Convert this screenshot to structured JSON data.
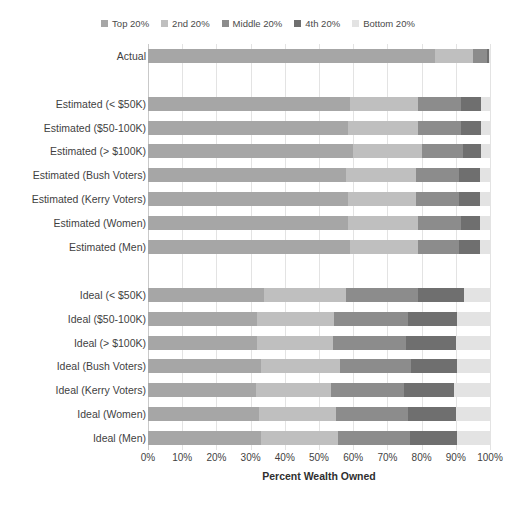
{
  "chart_data": {
    "type": "bar",
    "orientation": "horizontal",
    "stacked": true,
    "title": "",
    "xlabel": "Percent Wealth Owned",
    "ylabel": "",
    "xlim": [
      0,
      100
    ],
    "xticks": [
      "0%",
      "10%",
      "20%",
      "30%",
      "40%",
      "50%",
      "60%",
      "70%",
      "80%",
      "90%",
      "100%"
    ],
    "grid": true,
    "legend_position": "top",
    "legend": [
      "Top 20%",
      "2nd 20%",
      "Middle 20%",
      "4th 20%",
      "Bottom 20%"
    ],
    "colors": [
      "#a6a6a6",
      "#bfbfbf",
      "#8c8c8c",
      "#6f6f6f",
      "#e3e3e3"
    ],
    "categories": [
      "Actual",
      "",
      "Estimated (< $50K)",
      "Estimated ($50-100K)",
      "Estimated (> $100K)",
      "Estimated (Bush Voters)",
      "Estimated (Kerry Voters)",
      "Estimated (Women)",
      "Estimated (Men)",
      "",
      "Ideal (< $50K)",
      "Ideal ($50-100K)",
      "Ideal (> $100K)",
      "Ideal (Bush Voters)",
      "Ideal (Kerry Voters)",
      "Ideal (Women)",
      "Ideal (Men)"
    ],
    "series": [
      {
        "name": "Top 20%",
        "values": [
          84.0,
          null,
          59.0,
          58.5,
          60.0,
          58.0,
          58.5,
          58.5,
          59.0,
          null,
          34.0,
          32.0,
          32.0,
          33.0,
          31.5,
          32.5,
          33.0
        ]
      },
      {
        "name": "2nd 20%",
        "values": [
          11.0,
          null,
          20.0,
          20.5,
          20.0,
          20.5,
          20.0,
          20.5,
          20.0,
          null,
          24.0,
          22.5,
          22.0,
          23.0,
          22.0,
          22.5,
          22.5
        ]
      },
      {
        "name": "Middle 20%",
        "values": [
          4.0,
          null,
          12.5,
          12.5,
          12.0,
          12.5,
          12.5,
          12.5,
          12.0,
          null,
          21.0,
          21.5,
          21.5,
          21.0,
          21.5,
          21.0,
          21.0
        ]
      },
      {
        "name": "4th 20%",
        "values": [
          0.7,
          null,
          6.0,
          6.0,
          5.5,
          6.0,
          6.0,
          5.5,
          6.0,
          null,
          13.5,
          14.5,
          14.5,
          13.5,
          14.5,
          14.0,
          14.0
        ]
      },
      {
        "name": "Bottom 20%",
        "values": [
          0.3,
          null,
          2.5,
          2.5,
          2.5,
          3.0,
          3.0,
          3.0,
          3.0,
          null,
          7.5,
          9.5,
          10.0,
          9.5,
          10.5,
          10.0,
          9.5
        ]
      }
    ]
  }
}
